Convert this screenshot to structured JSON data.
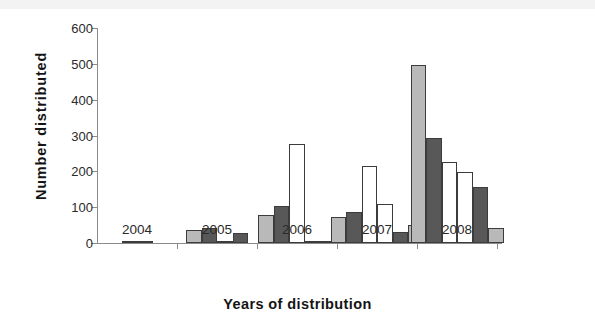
{
  "chart_data": {
    "type": "bar",
    "title": "",
    "xlabel": "Years of distribution",
    "ylabel": "Number distributed",
    "categories": [
      "2004",
      "2005",
      "2006",
      "2007",
      "2008"
    ],
    "ylim": [
      0,
      600
    ],
    "ytick_values": [
      0,
      100,
      200,
      300,
      400,
      500,
      600
    ],
    "ytick_labels": [
      "0",
      "100",
      "200",
      "300",
      "400",
      "500",
      "600"
    ],
    "grid": false,
    "legend": "none",
    "series_styles": {
      "light": "#b9b9b9",
      "dark": "#585858",
      "white": "#ffffff",
      "outline": "#3c3c3c"
    },
    "groups": [
      {
        "category": "2004",
        "bars": [
          {
            "style": "light",
            "value": 4
          },
          {
            "style": "dark",
            "value": 6
          }
        ]
      },
      {
        "category": "2005",
        "bars": [
          {
            "style": "light",
            "value": 35
          },
          {
            "style": "dark",
            "value": 42
          },
          {
            "style": "white",
            "value": 4
          },
          {
            "style": "dark",
            "value": 28
          }
        ]
      },
      {
        "category": "2006",
        "bars": [
          {
            "style": "light",
            "value": 78
          },
          {
            "style": "dark",
            "value": 103
          },
          {
            "style": "white",
            "value": 277
          },
          {
            "style": "white",
            "value": 7
          },
          {
            "style": "dark",
            "value": 4
          }
        ]
      },
      {
        "category": "2007",
        "bars": [
          {
            "style": "light",
            "value": 72
          },
          {
            "style": "dark",
            "value": 86
          },
          {
            "style": "white",
            "value": 216
          },
          {
            "style": "white",
            "value": 110
          },
          {
            "style": "dark",
            "value": 32
          },
          {
            "style": "light",
            "value": 50
          }
        ]
      },
      {
        "category": "2008",
        "bars": [
          {
            "style": "light",
            "value": 498
          },
          {
            "style": "dark",
            "value": 293
          },
          {
            "style": "white",
            "value": 226
          },
          {
            "style": "white",
            "value": 198
          },
          {
            "style": "dark",
            "value": 155
          },
          {
            "style": "light",
            "value": 42
          }
        ]
      }
    ]
  }
}
